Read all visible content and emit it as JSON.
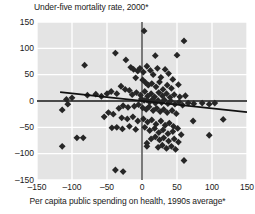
{
  "chart_data": {
    "type": "scatter",
    "title": "Under-five mortality rate, 2000*",
    "xlabel": "Per capita public spending on health, 1990s average*",
    "ylabel": "Under-five mortality rate, 2000*",
    "xlim": [
      -150,
      150
    ],
    "ylim": [
      -150,
      150
    ],
    "xticks": [
      -150,
      -100,
      -50,
      0,
      50,
      100,
      150
    ],
    "yticks": [
      -150,
      -100,
      -50,
      0,
      50,
      100,
      150
    ],
    "xtick_labels": [
      "–150",
      "–100",
      "–50",
      "0",
      "50",
      "100",
      "150"
    ],
    "ytick_labels": [
      "150",
      "100",
      "50",
      "0",
      "–50",
      "–100",
      "–150"
    ],
    "grid": true,
    "grid_color": "#ffffff",
    "plot_background": "#e4e4e4",
    "marker": "diamond",
    "marker_color": "#262626",
    "marker_size": 3.4,
    "legend": null,
    "zero_lines": {
      "horizontal": {
        "y": 0,
        "color": "#111111",
        "width": 1.4
      },
      "vertical": {
        "x": 0,
        "color": "#444444",
        "width": 1.4
      }
    },
    "trend_lines": [
      {
        "name": "fitted-regression-line",
        "color": "#111111",
        "width": 1.8,
        "x_start": -117,
        "y_start": 17,
        "x_end": 150,
        "y_end": -21
      }
    ],
    "points": [
      [
        3,
        133
      ],
      [
        60,
        114
      ],
      [
        -38,
        91
      ],
      [
        -82,
        68
      ],
      [
        -23,
        78
      ],
      [
        19,
        86
      ],
      [
        50,
        87
      ],
      [
        -16,
        64
      ],
      [
        -12,
        60
      ],
      [
        -6,
        57
      ],
      [
        -3,
        62
      ],
      [
        2,
        55
      ],
      [
        7,
        66
      ],
      [
        12,
        58
      ],
      [
        16,
        50
      ],
      [
        22,
        62
      ],
      [
        27,
        45
      ],
      [
        33,
        60
      ],
      [
        38,
        52
      ],
      [
        44,
        41
      ],
      [
        52,
        31
      ],
      [
        -9,
        44
      ],
      [
        1,
        40
      ],
      [
        5,
        35
      ],
      [
        9,
        30
      ],
      [
        14,
        33
      ],
      [
        20,
        27
      ],
      [
        25,
        36
      ],
      [
        30,
        22
      ],
      [
        36,
        30
      ],
      [
        42,
        24
      ],
      [
        -30,
        28
      ],
      [
        -24,
        22
      ],
      [
        -44,
        18
      ],
      [
        -50,
        14
      ],
      [
        -36,
        14
      ],
      [
        -18,
        20
      ],
      [
        -14,
        12
      ],
      [
        -8,
        16
      ],
      [
        -2,
        11
      ],
      [
        4,
        18
      ],
      [
        8,
        9
      ],
      [
        13,
        14
      ],
      [
        18,
        8
      ],
      [
        24,
        16
      ],
      [
        29,
        10
      ],
      [
        35,
        14
      ],
      [
        40,
        7
      ],
      [
        46,
        12
      ],
      [
        54,
        8
      ],
      [
        62,
        10
      ],
      [
        -58,
        9
      ],
      [
        -66,
        13
      ],
      [
        -78,
        11
      ],
      [
        -100,
        6
      ],
      [
        -108,
        3
      ],
      [
        -1,
        4
      ],
      [
        3,
        1
      ],
      [
        7,
        2
      ],
      [
        11,
        -2
      ],
      [
        15,
        3
      ],
      [
        19,
        -4
      ],
      [
        23,
        1
      ],
      [
        28,
        -3
      ],
      [
        32,
        2
      ],
      [
        37,
        -5
      ],
      [
        41,
        0
      ],
      [
        47,
        -6
      ],
      [
        53,
        -2
      ],
      [
        58,
        -8
      ],
      [
        66,
        -4
      ],
      [
        74,
        -5
      ],
      [
        86,
        -4
      ],
      [
        96,
        -6
      ],
      [
        104,
        -4
      ],
      [
        -5,
        -7
      ],
      [
        -11,
        -10
      ],
      [
        -20,
        -12
      ],
      [
        -27,
        -9
      ],
      [
        -33,
        -14
      ],
      [
        -114,
        -17
      ],
      [
        -106,
        -6
      ],
      [
        1,
        -13
      ],
      [
        6,
        -16
      ],
      [
        10,
        -11
      ],
      [
        16,
        -18
      ],
      [
        21,
        -14
      ],
      [
        26,
        -20
      ],
      [
        31,
        -16
      ],
      [
        36,
        -22
      ],
      [
        43,
        -18
      ],
      [
        49,
        -24
      ],
      [
        -41,
        -25
      ],
      [
        -48,
        -22
      ],
      [
        -54,
        -30
      ],
      [
        -29,
        -32
      ],
      [
        -21,
        -34
      ],
      [
        -13,
        -30
      ],
      [
        -6,
        -38
      ],
      [
        2,
        -34
      ],
      [
        8,
        -40
      ],
      [
        14,
        -36
      ],
      [
        20,
        -44
      ],
      [
        27,
        -38
      ],
      [
        33,
        -46
      ],
      [
        39,
        -42
      ],
      [
        45,
        -48
      ],
      [
        51,
        -52
      ],
      [
        73,
        -38
      ],
      [
        116,
        -35
      ],
      [
        -43,
        -51
      ],
      [
        -36,
        -50
      ],
      [
        -28,
        -53
      ],
      [
        -18,
        -48
      ],
      [
        -9,
        -54
      ],
      [
        4,
        -50
      ],
      [
        11,
        -56
      ],
      [
        18,
        -52
      ],
      [
        24,
        -60
      ],
      [
        30,
        -55
      ],
      [
        37,
        -62
      ],
      [
        44,
        -58
      ],
      [
        56,
        -64
      ],
      [
        96,
        -65
      ],
      [
        -84,
        -70
      ],
      [
        -93,
        -70
      ],
      [
        13,
        -72
      ],
      [
        19,
        -68
      ],
      [
        25,
        -74
      ],
      [
        31,
        -70
      ],
      [
        38,
        -76
      ],
      [
        46,
        -72
      ],
      [
        52,
        -78
      ],
      [
        7,
        -86
      ],
      [
        7,
        -80
      ],
      [
        23,
        -88
      ],
      [
        29,
        -84
      ],
      [
        35,
        -90
      ],
      [
        42,
        -86
      ],
      [
        48,
        -92
      ],
      [
        -114,
        -86
      ],
      [
        60,
        -113
      ],
      [
        -38,
        -131
      ],
      [
        -27,
        -134
      ]
    ]
  }
}
